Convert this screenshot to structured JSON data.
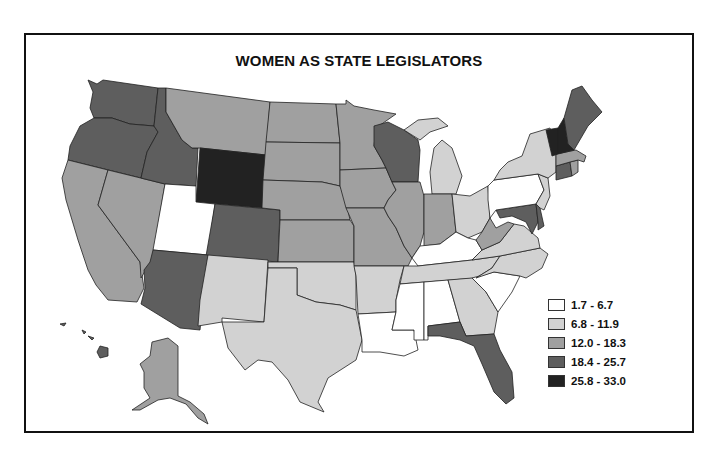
{
  "title": "WOMEN AS STATE LEGISLATORS",
  "legend": [
    {
      "label": "1.7 - 6.7",
      "color": "#ffffff"
    },
    {
      "label": "6.8 - 11.9",
      "color": "#d2d2d2"
    },
    {
      "label": "12.0 - 18.3",
      "color": "#a0a0a0"
    },
    {
      "label": "18.4 - 25.7",
      "color": "#5e5e5e"
    },
    {
      "label": "25.8 - 33.0",
      "color": "#222222"
    }
  ],
  "states": {
    "WA": 3,
    "OR": 3,
    "CA": 2,
    "NV": 2,
    "ID": 3,
    "MT": 2,
    "WY": 4,
    "UT": 0,
    "AZ": 3,
    "CO": 3,
    "NM": 1,
    "ND": 2,
    "SD": 2,
    "NE": 2,
    "KS": 2,
    "OK": 1,
    "TX": 1,
    "MN": 2,
    "IA": 2,
    "MO": 2,
    "AR": 1,
    "LA": 0,
    "WI": 3,
    "IL": 2,
    "MI": 1,
    "IN": 2,
    "OH": 1,
    "KY": 0,
    "TN": 1,
    "MS": 0,
    "AL": 0,
    "GA": 1,
    "FL": 3,
    "SC": 0,
    "NC": 1,
    "VA": 1,
    "WV": 2,
    "MD": 3,
    "DE": 3,
    "PA": 0,
    "NJ": 1,
    "NY": 1,
    "CT": 3,
    "RI": 2,
    "MA": 2,
    "VT": 4,
    "NH": 4,
    "ME": 3,
    "AK": 2,
    "HI": 3
  }
}
